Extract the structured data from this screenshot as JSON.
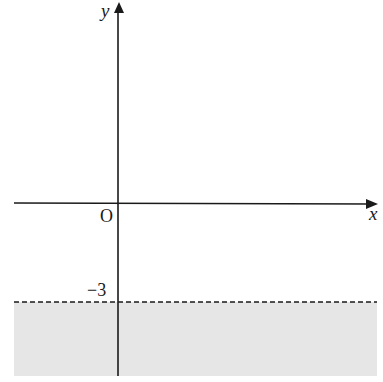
{
  "diagram": {
    "type": "inequality-graph",
    "axes": {
      "x_label": "x",
      "y_label": "y",
      "origin_label": "O"
    },
    "boundary": {
      "equation": "y = -3",
      "style": "dashed",
      "tick_label": "−3"
    },
    "shaded_region": {
      "description": "y < -3",
      "color": "#e6e6e6"
    },
    "colors": {
      "axis": "#1a1a1a",
      "shade": "#e6e6e6"
    }
  }
}
